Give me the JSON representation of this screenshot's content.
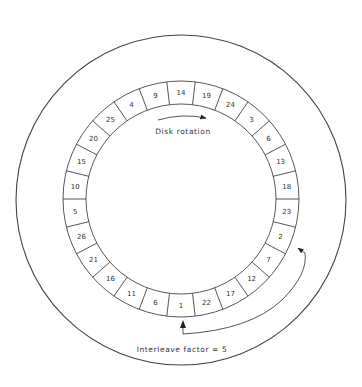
{
  "diagram": {
    "colors": {
      "stroke": "#444444",
      "text": "#333333",
      "background": "#ffffff"
    },
    "geometry": {
      "platter": {
        "cx": 181,
        "cy": 200,
        "r": 165
      },
      "ring": {
        "cx": 181,
        "cy": 199,
        "r_outer": 118,
        "r_inner": 95
      },
      "sector_count": 26,
      "first_sector_angle_deg": 0
    },
    "sectors_clockwise_from_top": [
      "14",
      "19",
      "24",
      "3",
      "6",
      "13",
      "18",
      "23",
      "2",
      "7",
      "12",
      "17",
      "22",
      "1",
      "6",
      "11",
      "16",
      "21",
      "26",
      "5",
      "10",
      "15",
      "20",
      "25",
      "4",
      "9"
    ],
    "labels": {
      "rotation": "Disk rotation",
      "interleave": "Interleave factor = 5"
    },
    "arrows": {
      "rotation": {
        "from": [
          158,
          119
        ],
        "to": [
          206,
          117
        ],
        "direction": "clockwise"
      },
      "interleave": {
        "from_sector": "1",
        "to_sector": "2",
        "description": "curved arrow from sector 1 around the outside of the ring to sector 2"
      }
    }
  }
}
